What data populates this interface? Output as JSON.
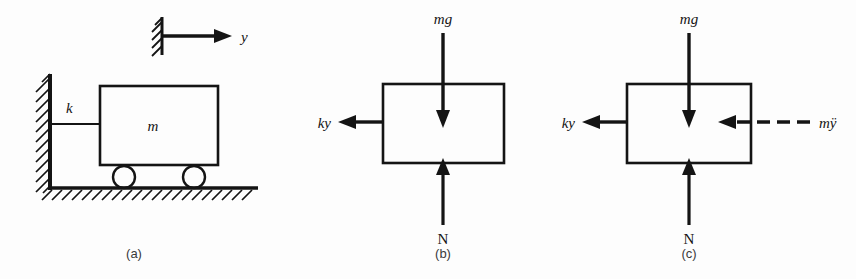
{
  "figure": {
    "background_color": "#fdfdfd",
    "ink_color": "#141414",
    "panels": [
      {
        "id": "a",
        "caption": "(a)",
        "description": "spring-mass cart on rollers against a wall",
        "labels": {
          "spring": "k",
          "mass": "m",
          "coordinate": "y"
        }
      },
      {
        "id": "b",
        "caption": "(b)",
        "description": "free body diagram of the mass",
        "labels": {
          "weight": "mg",
          "spring_force": "ky",
          "normal_force": "N"
        }
      },
      {
        "id": "c",
        "caption": "(c)",
        "description": "free body diagram with d'Alembert inertia force",
        "labels": {
          "weight": "mg",
          "spring_force": "ky",
          "normal_force": "N",
          "inertia_force": "mÿ"
        }
      }
    ]
  }
}
